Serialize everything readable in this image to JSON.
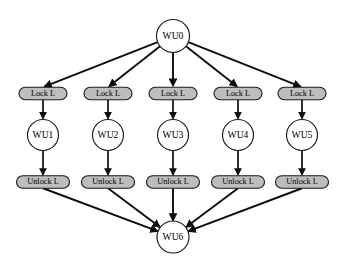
{
  "diagram": {
    "type": "directed-acyclic-graph",
    "colors": {
      "background": "#ffffff",
      "node_fill": "#ffffff",
      "pill_fill": "#bdbdbd",
      "stroke": "#1a1a1a",
      "edge": "#0d0d0d",
      "text": "#000000"
    },
    "nodes": {
      "root": {
        "id": "WU0",
        "label": "WU0",
        "shape": "circle",
        "cx": 173,
        "cy": 36,
        "r": 16.5
      },
      "sink": {
        "id": "WU6",
        "label": "WU6",
        "shape": "circle",
        "cx": 173,
        "cy": 237,
        "r": 16.0
      },
      "branches": [
        {
          "index": 0,
          "cx": 43,
          "lock": {
            "label": "Lock L",
            "shape": "pill",
            "cy": 93.5,
            "w": 48,
            "h": 12.5
          },
          "worker": {
            "id": "WU1",
            "label": "WU1",
            "shape": "circle",
            "cy": 135,
            "r": 15.5
          },
          "unlock": {
            "label": "Unlock L",
            "shape": "pill",
            "cy": 182,
            "w": 53,
            "h": 12.5
          }
        },
        {
          "index": 1,
          "cx": 108,
          "lock": {
            "label": "Lock L",
            "shape": "pill",
            "cy": 93.5,
            "w": 48,
            "h": 12.5
          },
          "worker": {
            "id": "WU2",
            "label": "WU2",
            "shape": "circle",
            "cy": 135,
            "r": 15.5
          },
          "unlock": {
            "label": "Unlock L",
            "shape": "pill",
            "cy": 182,
            "w": 53,
            "h": 12.5
          }
        },
        {
          "index": 2,
          "cx": 173,
          "lock": {
            "label": "Lock L",
            "shape": "pill",
            "cy": 93.5,
            "w": 48,
            "h": 12.5
          },
          "worker": {
            "id": "WU3",
            "label": "WU3",
            "shape": "circle",
            "cy": 135,
            "r": 15.5
          },
          "unlock": {
            "label": "Unlock L",
            "shape": "pill",
            "cy": 182,
            "w": 53,
            "h": 12.5
          }
        },
        {
          "index": 3,
          "cx": 238,
          "lock": {
            "label": "Lock L",
            "shape": "pill",
            "cy": 93.5,
            "w": 48,
            "h": 12.5
          },
          "worker": {
            "id": "WU4",
            "label": "WU4",
            "shape": "circle",
            "cy": 135,
            "r": 15.5
          },
          "unlock": {
            "label": "Unlock L",
            "shape": "pill",
            "cy": 182,
            "w": 53,
            "h": 12.5
          }
        },
        {
          "index": 4,
          "cx": 302,
          "lock": {
            "label": "Lock L",
            "shape": "pill",
            "cy": 93.5,
            "w": 48,
            "h": 12.5
          },
          "worker": {
            "id": "WU5",
            "label": "WU5",
            "shape": "circle",
            "cy": 135,
            "r": 15.5
          },
          "unlock": {
            "label": "Unlock L",
            "shape": "pill",
            "cy": 182,
            "w": 53,
            "h": 12.5
          }
        }
      ]
    },
    "edges": [
      {
        "from": "WU0",
        "to": "Lock L (1)"
      },
      {
        "from": "WU0",
        "to": "Lock L (2)"
      },
      {
        "from": "WU0",
        "to": "Lock L (3)"
      },
      {
        "from": "WU0",
        "to": "Lock L (4)"
      },
      {
        "from": "WU0",
        "to": "Lock L (5)"
      },
      {
        "from": "Lock L (1)",
        "to": "WU1"
      },
      {
        "from": "Lock L (2)",
        "to": "WU2"
      },
      {
        "from": "Lock L (3)",
        "to": "WU3"
      },
      {
        "from": "Lock L (4)",
        "to": "WU4"
      },
      {
        "from": "Lock L (5)",
        "to": "WU5"
      },
      {
        "from": "WU1",
        "to": "Unlock L (1)"
      },
      {
        "from": "WU2",
        "to": "Unlock L (2)"
      },
      {
        "from": "WU3",
        "to": "Unlock L (3)"
      },
      {
        "from": "WU4",
        "to": "Unlock L (4)"
      },
      {
        "from": "WU5",
        "to": "Unlock L (5)"
      },
      {
        "from": "Unlock L (1)",
        "to": "WU6"
      },
      {
        "from": "Unlock L (2)",
        "to": "WU6"
      },
      {
        "from": "Unlock L (3)",
        "to": "WU6"
      },
      {
        "from": "Unlock L (4)",
        "to": "WU6"
      },
      {
        "from": "Unlock L (5)",
        "to": "WU6"
      }
    ]
  }
}
